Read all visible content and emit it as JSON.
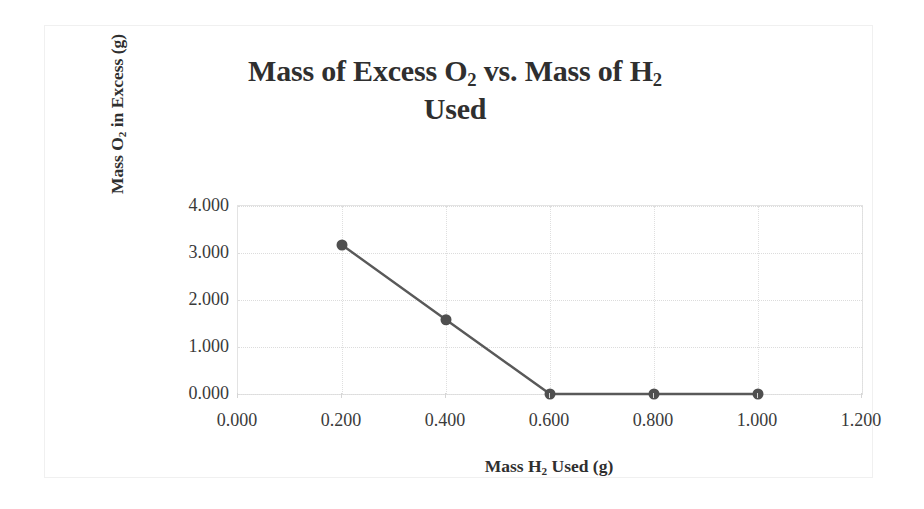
{
  "chart_data": {
    "type": "line",
    "title": "Mass of Excess O2 vs. Mass of H2 Used",
    "title_line1_parts": [
      "Mass of Excess O",
      "2",
      " vs. Mass of H",
      "2"
    ],
    "title_line2": "Used",
    "xlabel_parts": [
      "Mass H",
      "2",
      " Used (g)"
    ],
    "ylabel_parts": [
      "Mass O",
      "2",
      " in Excess (g)"
    ],
    "xlabel": "Mass H2 Used (g)",
    "ylabel": "Mass O2 in Excess (g)",
    "x": [
      0.2,
      0.4,
      0.6,
      0.8,
      1.0
    ],
    "values": [
      3.17,
      1.58,
      0.0,
      0.0,
      0.0
    ],
    "series": [
      {
        "name": "Mass O2 in Excess (g)",
        "x": [
          0.2,
          0.4,
          0.6,
          0.8,
          1.0
        ],
        "values": [
          3.17,
          1.58,
          0.0,
          0.0,
          0.0
        ]
      }
    ],
    "xlim": [
      0.0,
      1.2
    ],
    "ylim": [
      0.0,
      4.0
    ],
    "x_ticks": [
      0.0,
      0.2,
      0.4,
      0.6,
      0.8,
      1.0,
      1.2
    ],
    "y_ticks": [
      0.0,
      1.0,
      2.0,
      3.0,
      4.0
    ],
    "x_tick_labels": [
      "0.000",
      "0.200",
      "0.400",
      "0.600",
      "0.800",
      "1.000",
      "1.200"
    ],
    "y_tick_labels": [
      "0.000",
      "1.000",
      "2.000",
      "3.000",
      "4.000"
    ],
    "grid": true,
    "grid_axis": "both",
    "legend": false,
    "legend_position": "none",
    "marker": "circle",
    "marker_size": 11,
    "annotations": []
  },
  "style": {
    "series_color": "#595959",
    "marker_color": "#4f4f4f",
    "grid_color": "#dcdcdc",
    "axis_color": "#e3e3e3",
    "text_color": "#2f2f2f",
    "tick_text_color": "#3a3a3a",
    "background": "#ffffff",
    "frame_border": "#f0f0f0"
  }
}
